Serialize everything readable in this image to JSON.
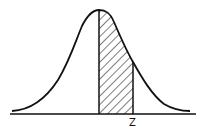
{
  "diagram": {
    "type": "normal-distribution-curve",
    "shaded_region": "between mean (0) and z",
    "shading": "diagonal hatch",
    "labels": {
      "z": "Z"
    },
    "colors": {
      "stroke": "#111111",
      "background": "#ffffff"
    }
  }
}
